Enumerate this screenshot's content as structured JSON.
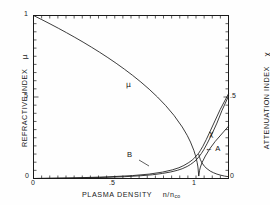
{
  "figure": {
    "background": "#fefefe",
    "ink": "#1a1a1a"
  },
  "axes": {
    "left_title": "REFRACTIVE  INDEX",
    "left_symbol": "μ",
    "right_title": "ATTENUATION  INDEX",
    "right_symbol": "χ",
    "x_title": "PLASMA   DENSITY",
    "x_symbol_num": "n/n",
    "x_symbol_sub": "co",
    "x_ticks": [
      "0",
      ".5",
      "1"
    ],
    "y_ticks_left": [
      "0",
      ".5",
      "1"
    ],
    "y_ticks_right": [
      "0",
      ".5"
    ]
  },
  "annotations": {
    "mu_label": "μ",
    "chi_label": "χ",
    "branch_a": "←  A",
    "branch_b": "B"
  },
  "chart_data": {
    "type": "line",
    "title": "",
    "xlabel": "PLASMA DENSITY n/n_co",
    "ylabel": "REFRACTIVE INDEX μ",
    "y2label": "ATTENUATION INDEX χ",
    "xlim": [
      0,
      1.18
    ],
    "ylim": [
      0,
      1
    ],
    "y2lim": [
      0,
      1
    ],
    "grid": false,
    "legend": null,
    "x_tick_values": [
      0,
      0.5,
      1
    ],
    "y_tick_values": [
      0,
      0.5,
      1
    ],
    "y2_tick_values": [
      0,
      0.5
    ],
    "series": [
      {
        "name": "μ (refractive index)",
        "axis": "left",
        "label_at": [
          0.58,
          0.565
        ],
        "x": [
          0,
          0.05,
          0.1,
          0.15,
          0.2,
          0.25,
          0.3,
          0.35,
          0.4,
          0.45,
          0.5,
          0.55,
          0.6,
          0.65,
          0.7,
          0.75,
          0.8,
          0.85,
          0.9,
          0.93,
          0.95,
          0.97,
          0.98,
          0.99,
          0.995,
          1.0,
          1.005,
          1.01,
          1.02,
          1.04,
          1.07,
          1.1,
          1.15,
          1.18
        ],
        "y": [
          1.0,
          0.9747,
          0.9487,
          0.922,
          0.8944,
          0.866,
          0.8367,
          0.8062,
          0.7746,
          0.7416,
          0.7071,
          0.6708,
          0.6325,
          0.5916,
          0.5477,
          0.5,
          0.4472,
          0.3873,
          0.3162,
          0.2646,
          0.2236,
          0.1732,
          0.1414,
          0.1,
          0.0707,
          0.015,
          0.05,
          0.07,
          0.098,
          0.138,
          0.187,
          0.228,
          0.286,
          0.321
        ]
      },
      {
        "name": "χ branch A (low collision frequency)",
        "axis": "right",
        "label_at": [
          1.05,
          0.275
        ],
        "x": [
          0,
          0.2,
          0.4,
          0.55,
          0.65,
          0.72,
          0.78,
          0.83,
          0.87,
          0.9,
          0.93,
          0.95,
          0.97,
          0.985,
          1.0,
          1.015,
          1.03,
          1.05,
          1.08,
          1.11,
          1.14,
          1.18
        ],
        "y": [
          0.0,
          0.002,
          0.006,
          0.011,
          0.017,
          0.023,
          0.031,
          0.04,
          0.05,
          0.06,
          0.074,
          0.086,
          0.101,
          0.114,
          0.132,
          0.152,
          0.176,
          0.213,
          0.273,
          0.34,
          0.416,
          0.505
        ]
      },
      {
        "name": "χ branch B (higher collision frequency)",
        "axis": "right",
        "label_at": [
          0.62,
          0.105
        ],
        "x": [
          0,
          0.25,
          0.45,
          0.6,
          0.7,
          0.78,
          0.84,
          0.88,
          0.91,
          0.94,
          0.96,
          0.975,
          0.99,
          1.0,
          1.01,
          1.025,
          1.045,
          1.07,
          1.1,
          1.13,
          1.18
        ],
        "y": [
          0.0,
          0.004,
          0.01,
          0.018,
          0.027,
          0.039,
          0.053,
          0.066,
          0.08,
          0.098,
          0.113,
          0.127,
          0.145,
          0.156,
          0.172,
          0.198,
          0.238,
          0.292,
          0.358,
          0.424,
          0.52
        ]
      },
      {
        "name": "μ decay branch (descending past cutoff)",
        "axis": "left",
        "x": [
          1.0,
          1.005,
          1.01,
          1.02,
          1.035,
          1.05,
          1.07,
          1.09,
          1.11,
          1.13,
          1.155,
          1.18
        ],
        "y": [
          0.148,
          0.13,
          0.115,
          0.095,
          0.074,
          0.06,
          0.045,
          0.035,
          0.027,
          0.021,
          0.015,
          0.011
        ]
      }
    ]
  }
}
